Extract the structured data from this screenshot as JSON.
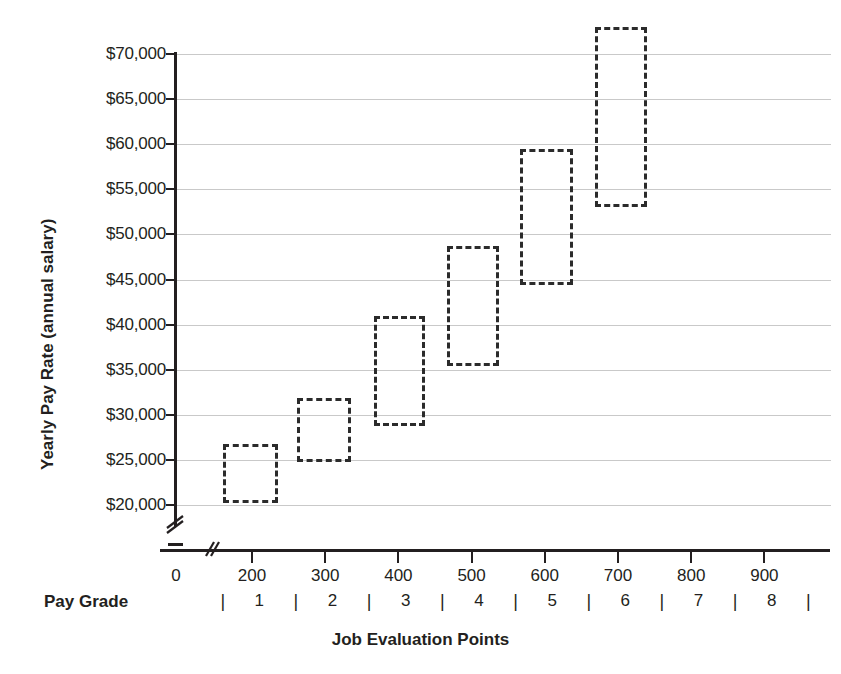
{
  "chart_data": {
    "type": "bar",
    "title": "",
    "xlabel": "Job Evaluation Points",
    "ylabel": "Yearly Pay Rate (annual salary)",
    "secondary_xlabel": "Pay Grade",
    "xlim": [
      0,
      950
    ],
    "ylim": [
      18500,
      73500
    ],
    "y_axis_break": true,
    "x_axis_break": true,
    "grid": true,
    "legend": "none",
    "y_tick_labels": [
      "$70,000",
      "$65,000",
      "$60,000",
      "$55,000",
      "$50,000",
      "$45,000",
      "$40,000",
      "$35,000",
      "$30,000",
      "$25,000",
      "$20,000"
    ],
    "y_tick_values": [
      70000,
      65000,
      60000,
      55000,
      50000,
      45000,
      40000,
      35000,
      30000,
      25000,
      20000
    ],
    "x_tick_labels": [
      "0",
      "200",
      "300",
      "400",
      "500",
      "600",
      "700",
      "800",
      "900"
    ],
    "x_tick_values": [
      0,
      200,
      300,
      400,
      500,
      600,
      700,
      800,
      900
    ],
    "pay_grade_labels": [
      "1",
      "2",
      "3",
      "4",
      "5",
      "6",
      "7",
      "8"
    ],
    "pay_grade_boundaries": [
      160,
      260,
      360,
      460,
      560,
      660,
      760,
      860,
      960
    ],
    "series_name": "Pay grade ranges",
    "boxes": [
      {
        "grade": "1",
        "points_min": 160,
        "points_max": 235,
        "pay_min": 20200,
        "pay_max": 26800
      },
      {
        "grade": "2",
        "points_min": 262,
        "points_max": 335,
        "pay_min": 24800,
        "pay_max": 31900
      },
      {
        "grade": "3",
        "points_min": 366,
        "points_max": 437,
        "pay_min": 28800,
        "pay_max": 41000
      },
      {
        "grade": "4",
        "points_min": 467,
        "points_max": 537,
        "pay_min": 35400,
        "pay_max": 48700
      },
      {
        "grade": "5",
        "points_min": 566,
        "points_max": 639,
        "pay_min": 44400,
        "pay_max": 59500
      },
      {
        "grade": "6",
        "points_min": 668,
        "points_max": 740,
        "pay_min": 53000,
        "pay_max": 73000
      }
    ]
  },
  "axes": {
    "y_title": "Yearly Pay Rate (annual salary)",
    "x_title": "Job Evaluation Points",
    "pay_grade_title": "Pay Grade"
  },
  "colors": {
    "box_stroke": "#2b2b2b",
    "gridline": "#c9c9c9",
    "axis": "#231f20",
    "text": "#231f20",
    "background": "#ffffff"
  }
}
